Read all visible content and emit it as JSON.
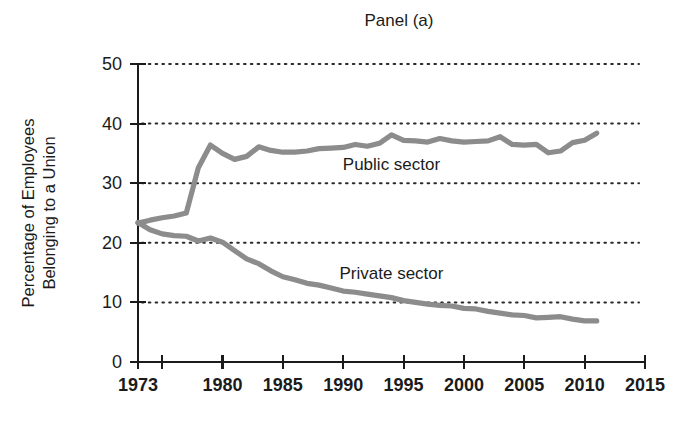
{
  "chart_data": {
    "type": "line",
    "title": "Panel (a)",
    "xlabel": "",
    "ylabel": "Percentage of Employees Belonging to a Union",
    "ylabel_lines": [
      "Percentage of Employees",
      "Belonging to a Union"
    ],
    "xlim": [
      1973,
      2015
    ],
    "ylim": [
      0,
      50
    ],
    "xticks": [
      1973,
      1975,
      1980,
      1985,
      1990,
      1995,
      2000,
      2005,
      2010,
      2015
    ],
    "xtick_labels": [
      "1973",
      "",
      "1980",
      "1985",
      "1990",
      "1995",
      "2000",
      "2005",
      "2010",
      "2015"
    ],
    "yticks": [
      0,
      10,
      20,
      30,
      40,
      50
    ],
    "ytick_labels": [
      "0",
      "10",
      "20",
      "30",
      "40",
      "50"
    ],
    "grid": "horizontal-dotted",
    "legend_position": "inline-annotations",
    "line_color": "#8c8c8c",
    "axis_color": "#1b1b1b",
    "series": [
      {
        "name": "Public sector",
        "label": "Public sector",
        "color": "#8c8c8c",
        "label_x": 1994,
        "label_y": 32.2,
        "x": [
          1973,
          1974,
          1975,
          1976,
          1977,
          1978,
          1979,
          1980,
          1981,
          1982,
          1983,
          1984,
          1985,
          1986,
          1987,
          1988,
          1989,
          1990,
          1991,
          1992,
          1993,
          1994,
          1995,
          1996,
          1997,
          1998,
          1999,
          2000,
          2001,
          2002,
          2003,
          2004,
          2005,
          2006,
          2007,
          2008,
          2009,
          2010,
          2011
        ],
        "values": [
          23.3,
          23.8,
          24.2,
          24.5,
          25.0,
          32.6,
          36.4,
          35.0,
          34.0,
          34.5,
          36.1,
          35.5,
          35.2,
          35.2,
          35.4,
          35.8,
          35.9,
          36.0,
          36.5,
          36.2,
          36.7,
          38.1,
          37.2,
          37.1,
          36.9,
          37.5,
          37.1,
          36.9,
          37.0,
          37.1,
          37.8,
          36.5,
          36.4,
          36.5,
          35.1,
          35.4,
          36.8,
          37.2,
          38.4
        ]
      },
      {
        "name": "Private sector",
        "label": "Private sector",
        "color": "#8c8c8c",
        "label_x": 1994,
        "label_y": 14.0,
        "x": [
          1973,
          1974,
          1975,
          1976,
          1977,
          1978,
          1979,
          1980,
          1981,
          1982,
          1983,
          1984,
          1985,
          1986,
          1987,
          1988,
          1989,
          1990,
          1991,
          1992,
          1993,
          1994,
          1995,
          1996,
          1997,
          1998,
          1999,
          2000,
          2001,
          2002,
          2003,
          2004,
          2005,
          2006,
          2007,
          2008,
          2009,
          2010,
          2011
        ],
        "values": [
          23.4,
          22.2,
          21.5,
          21.2,
          21.1,
          20.3,
          20.8,
          20.1,
          18.7,
          17.3,
          16.5,
          15.3,
          14.3,
          13.8,
          13.2,
          12.9,
          12.4,
          11.9,
          11.7,
          11.4,
          11.1,
          10.8,
          10.3,
          10.0,
          9.7,
          9.5,
          9.4,
          9.0,
          8.9,
          8.5,
          8.2,
          7.9,
          7.8,
          7.4,
          7.5,
          7.6,
          7.2,
          6.9,
          6.9
        ]
      }
    ]
  },
  "figure": {
    "title": "Panel (a)",
    "y_axis_line1": "Percentage of Employees",
    "y_axis_line2": "Belonging to a Union"
  }
}
